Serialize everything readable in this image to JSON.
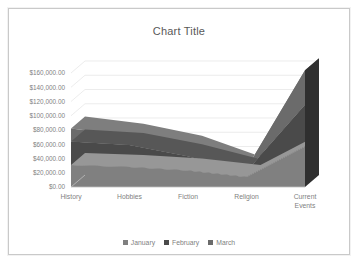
{
  "chart_data": {
    "type": "area",
    "subtype": "3d-stacked-area",
    "title": "Chart Title",
    "xlabel": "",
    "ylabel": "",
    "categories": [
      "History",
      "Hobbies",
      "Fiction",
      "Religion",
      "Current Events"
    ],
    "series": [
      {
        "name": "January",
        "color": "#808080",
        "values": [
          31000,
          28000,
          23000,
          14000,
          57000
        ]
      },
      {
        "name": "February",
        "color": "#4a4a4a",
        "values": [
          33000,
          31000,
          20000,
          8000,
          58000
        ]
      },
      {
        "name": "March",
        "color": "#6b6b6b",
        "values": [
          18000,
          13000,
          12000,
          4000,
          49000
        ]
      }
    ],
    "stacked_totals": [
      82000,
      72000,
      55000,
      26000,
      164000
    ],
    "ylim": [
      0,
      160000
    ],
    "ytick_values": [
      0,
      20000,
      40000,
      60000,
      80000,
      100000,
      120000,
      140000,
      160000
    ],
    "ytick_labels": [
      "$0.00",
      "$20,000.00",
      "$40,000.00",
      "$60,000.00",
      "$80,000.00",
      "$100,000.00",
      "$120,000.00",
      "$140,000.00",
      "$160,000.00"
    ],
    "grid": true,
    "legend_position": "bottom",
    "currency_prefix": "$",
    "value_format": "#,##0.00"
  },
  "legend": {
    "items": [
      {
        "label": "January",
        "color": "#808080",
        "marker": "square-marker"
      },
      {
        "label": "February",
        "color": "#4a4a4a",
        "marker": "square-marker"
      },
      {
        "label": "March",
        "color": "#6b6b6b",
        "marker": "square-marker"
      }
    ]
  },
  "colors": {
    "gridline": "#e4e4e4",
    "axis_text": "#7f7f7f",
    "title_text": "#595959",
    "frame_border": "#c9c9c9",
    "depth_shade": "#2f2f2f",
    "plot_background": "#ffffff"
  }
}
